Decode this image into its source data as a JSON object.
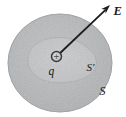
{
  "figure": {
    "type": "physics-diagram",
    "labels": {
      "field": "E",
      "charge": "q",
      "outer_surface": "S",
      "inner_surface": "S′",
      "charge_sign": "+"
    },
    "colors": {
      "background": "#ffffff",
      "sphere_fill_center": "#d0d2d3",
      "sphere_fill_edge": "#bfc1c3",
      "sphere_edge": "#aeb0b2",
      "blob_fill_center": "#dadbdc",
      "blob_fill_edge": "#cdcfd1",
      "blob_edge": "#b9bbbd",
      "charge_fill": "#b7b9bb",
      "charge_ring": "#3c3c3c",
      "line": "#1c1c1c",
      "text": "#1a1a1a"
    }
  }
}
